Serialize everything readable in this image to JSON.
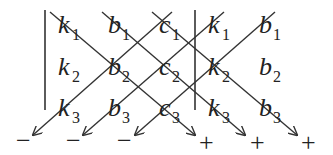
{
  "diagram": {
    "columns": [
      {
        "label": "k",
        "x": 70
      },
      {
        "label": "b",
        "x": 120
      },
      {
        "label": "c",
        "x": 170
      },
      {
        "label": "k",
        "x": 220
      },
      {
        "label": "b",
        "x": 270
      }
    ],
    "rows": [
      {
        "sub": "1",
        "y": 33
      },
      {
        "sub": "2",
        "y": 75
      },
      {
        "sub": "3",
        "y": 116
      }
    ],
    "cells": [
      [
        "k",
        "b",
        "c",
        "k",
        "b"
      ],
      [
        "k",
        "b",
        "c",
        "k",
        "b"
      ],
      [
        "k",
        "b",
        "c",
        "k",
        "b"
      ]
    ],
    "minus_signs": [
      "−",
      "−",
      "−"
    ],
    "plus_signs": [
      "+",
      "+",
      "+"
    ],
    "minus_x": [
      25,
      75,
      125
    ],
    "plus_x": [
      210,
      260,
      310
    ],
    "sign_y": 146,
    "line_color": "#333333"
  }
}
